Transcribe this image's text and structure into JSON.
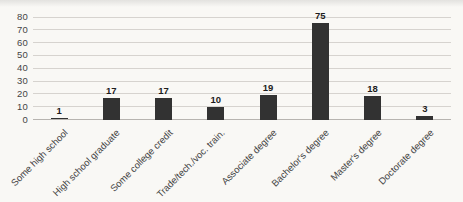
{
  "chart_data": {
    "type": "bar",
    "title": "",
    "xlabel": "",
    "ylabel": "",
    "categories": [
      "Some high school",
      "High school graduate",
      "Some college credit",
      "Trade/tech./voc. train.",
      "Associate degree",
      "Bachelor's degree",
      "Master's degree",
      "Doctorate degree"
    ],
    "values": [
      1,
      17,
      17,
      10,
      19,
      75,
      18,
      3
    ],
    "data_labels": true,
    "ylim": [
      0,
      80
    ],
    "yticks": [
      0,
      10,
      20,
      30,
      40,
      50,
      60,
      70,
      80
    ],
    "grid": true,
    "legend": false,
    "colors": {
      "bar": "#323232",
      "gridline": "#d6d3cf",
      "axis_line": "#b7b4b0",
      "tick_label": "#454545",
      "category_label": "#454545",
      "data_label": "#1d1d1d",
      "background": "#f9f8f5"
    }
  }
}
